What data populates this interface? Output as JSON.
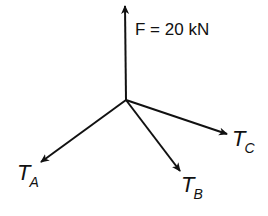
{
  "diagram": {
    "type": "free-body force diagram",
    "stroke_color": "#111111",
    "background": "#ffffff",
    "origin": {
      "x": 126,
      "y": 100
    },
    "forces": [
      {
        "id": "F",
        "label": "F = 20 kN",
        "direction": "up",
        "tip": {
          "x": 125,
          "y": 5
        }
      },
      {
        "id": "TA",
        "label_main": "T",
        "label_sub": "A",
        "direction": "down-left",
        "tip": {
          "x": 40,
          "y": 163
        }
      },
      {
        "id": "TB",
        "label_main": "T",
        "label_sub": "B",
        "direction": "down-right",
        "tip": {
          "x": 181,
          "y": 172
        }
      },
      {
        "id": "TC",
        "label_main": "T",
        "label_sub": "C",
        "direction": "right-slightly-down",
        "tip": {
          "x": 228,
          "y": 134
        }
      }
    ]
  }
}
